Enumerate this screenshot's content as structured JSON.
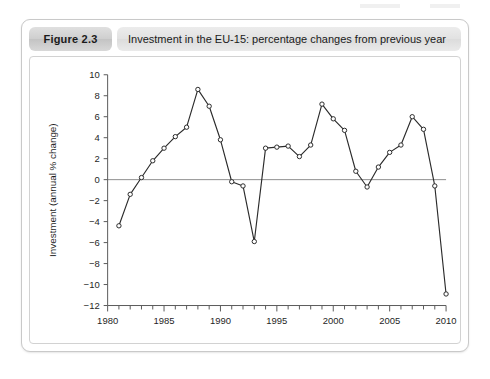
{
  "figure": {
    "number_label": "Figure 2.3",
    "caption": "Investment in the EU-15: percentage changes from previous year"
  },
  "chart_data": {
    "type": "line",
    "title": "Investment in the EU-15: percentage changes from previous year",
    "xlabel": "",
    "ylabel": "Investment (annual % change)",
    "xlim": [
      1980,
      2010
    ],
    "ylim": [
      -12,
      10
    ],
    "ytick_step": 2,
    "xtick_major_step": 5,
    "xtick_minor_step": 1,
    "grid": false,
    "legend": false,
    "zero_line": true,
    "marker": "open-circle",
    "x": [
      1981,
      1982,
      1983,
      1984,
      1985,
      1986,
      1987,
      1988,
      1989,
      1990,
      1991,
      1992,
      1993,
      1994,
      1995,
      1996,
      1997,
      1998,
      1999,
      2000,
      2001,
      2002,
      2003,
      2004,
      2005,
      2006,
      2007,
      2008,
      2009,
      2010
    ],
    "values": [
      -4.4,
      -1.4,
      0.2,
      1.8,
      3.0,
      4.1,
      5.0,
      8.6,
      7.0,
      3.8,
      -0.2,
      -0.6,
      -5.9,
      3.0,
      3.1,
      3.2,
      2.2,
      3.3,
      7.2,
      5.8,
      4.7,
      0.8,
      -0.7,
      1.2,
      2.6,
      3.3,
      6.0,
      4.8,
      -0.6,
      -10.9
    ],
    "ytick_labels": [
      "10",
      "8",
      "6",
      "4",
      "2",
      "0",
      "-2",
      "-4",
      "-6",
      "-8",
      "-10",
      "-12"
    ],
    "ytick_values": [
      10,
      8,
      6,
      4,
      2,
      0,
      -2,
      -4,
      -6,
      -8,
      -10,
      -12
    ],
    "xtick_labels": [
      "1980",
      "1985",
      "1990",
      "1995",
      "2000",
      "2005",
      "2010"
    ],
    "xtick_values": [
      1980,
      1985,
      1990,
      1995,
      2000,
      2005,
      2010
    ],
    "colors": {
      "line": "#2b2b2b",
      "marker_face": "#ffffff",
      "marker_edge": "#2b2b2b",
      "axis": "#5a5a5a",
      "zero_line": "#8d8d8d"
    }
  }
}
